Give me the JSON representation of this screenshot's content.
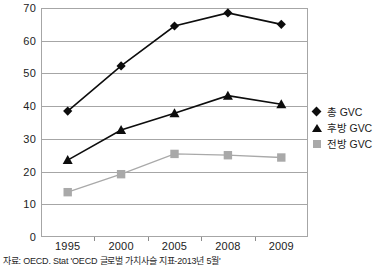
{
  "chart_data": {
    "type": "line",
    "title": "",
    "xlabel": "",
    "ylabel": "",
    "categories": [
      "1995",
      "2000",
      "2005",
      "2008",
      "2009"
    ],
    "ylim": [
      0,
      70
    ],
    "yticks": [
      0,
      10,
      20,
      30,
      40,
      50,
      60,
      70
    ],
    "grid": true,
    "legend_position": "right",
    "series": [
      {
        "name": "총 GVC",
        "marker": "diamond",
        "color": "#0d0d0d",
        "values": [
          38.5,
          52.3,
          64.5,
          68.5,
          65.0
        ]
      },
      {
        "name": "후방 GVC",
        "marker": "triangle",
        "color": "#0d0d0d",
        "values": [
          23.5,
          32.7,
          37.8,
          43.2,
          40.6
        ]
      },
      {
        "name": "전방 GVC",
        "marker": "square",
        "color": "#a9a9a9",
        "values": [
          13.7,
          19.2,
          25.4,
          25.0,
          24.3
        ]
      }
    ]
  },
  "footer": {
    "source": "자료: OECD. Stat 'OECD 글로벌 가치사슬 지표-2013년 5월'"
  }
}
